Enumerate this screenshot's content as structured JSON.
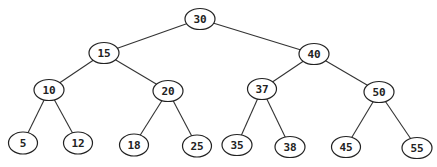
{
  "diagram": {
    "type": "binary-search-tree",
    "nodes": [
      {
        "id": "n30",
        "label": "30",
        "cx": 200,
        "cy": 19,
        "rx": 15,
        "ry": 10.5
      },
      {
        "id": "n15",
        "label": "15",
        "cx": 104,
        "cy": 53,
        "rx": 15,
        "ry": 10.5
      },
      {
        "id": "n40",
        "label": "40",
        "cx": 314,
        "cy": 54,
        "rx": 15,
        "ry": 10.5
      },
      {
        "id": "n10",
        "label": "10",
        "cx": 49,
        "cy": 90,
        "rx": 15,
        "ry": 10.5
      },
      {
        "id": "n20",
        "label": "20",
        "cx": 168,
        "cy": 91,
        "rx": 15,
        "ry": 10.5
      },
      {
        "id": "n37",
        "label": "37",
        "cx": 262,
        "cy": 89,
        "rx": 14.5,
        "ry": 10.5
      },
      {
        "id": "n50",
        "label": "50",
        "cx": 379,
        "cy": 92,
        "rx": 15,
        "ry": 10.5
      },
      {
        "id": "n5",
        "label": "5",
        "cx": 23,
        "cy": 143,
        "rx": 14.5,
        "ry": 11
      },
      {
        "id": "n12",
        "label": "12",
        "cx": 78,
        "cy": 143,
        "rx": 14.5,
        "ry": 11
      },
      {
        "id": "n18",
        "label": "18",
        "cx": 134,
        "cy": 145,
        "rx": 14.5,
        "ry": 11
      },
      {
        "id": "n25",
        "label": "25",
        "cx": 197,
        "cy": 146,
        "rx": 14.5,
        "ry": 11
      },
      {
        "id": "n35",
        "label": "35",
        "cx": 237,
        "cy": 145,
        "rx": 15,
        "ry": 10.5
      },
      {
        "id": "n38",
        "label": "38",
        "cx": 290,
        "cy": 147,
        "rx": 15,
        "ry": 10.5
      },
      {
        "id": "n45",
        "label": "45",
        "cx": 346,
        "cy": 147,
        "rx": 14.5,
        "ry": 10.5
      },
      {
        "id": "n55",
        "label": "55",
        "cx": 417,
        "cy": 148,
        "rx": 15,
        "ry": 10.5
      }
    ],
    "edges": [
      [
        "n30",
        "n15"
      ],
      [
        "n30",
        "n40"
      ],
      [
        "n15",
        "n10"
      ],
      [
        "n15",
        "n20"
      ],
      [
        "n40",
        "n37"
      ],
      [
        "n40",
        "n50"
      ],
      [
        "n10",
        "n5"
      ],
      [
        "n10",
        "n12"
      ],
      [
        "n20",
        "n18"
      ],
      [
        "n20",
        "n25"
      ],
      [
        "n37",
        "n35"
      ],
      [
        "n37",
        "n38"
      ],
      [
        "n50",
        "n45"
      ],
      [
        "n50",
        "n55"
      ]
    ]
  }
}
